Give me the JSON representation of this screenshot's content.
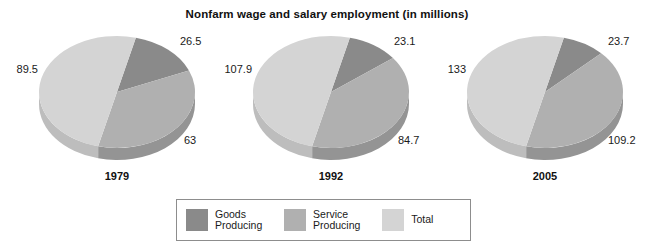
{
  "chart_data": {
    "type": "pie",
    "title": "Nonfarm wage and salary employment (in millions)",
    "subtitle": "",
    "xlabel": "",
    "ylabel": "",
    "unit": "millions",
    "grid": false,
    "legend_position": "bottom",
    "series_names": [
      "Goods Producing",
      "Service Producing",
      "Total"
    ],
    "charts": [
      {
        "year": "1979",
        "labels": [
          "Goods Producing",
          "Service Producing",
          "Total"
        ],
        "values": [
          26.5,
          63,
          89.5
        ],
        "display_values": [
          "26.5",
          "63",
          "89.5"
        ]
      },
      {
        "year": "1992",
        "labels": [
          "Goods Producing",
          "Service Producing",
          "Total"
        ],
        "values": [
          23.1,
          84.7,
          107.9
        ],
        "display_values": [
          "23.1",
          "84.7",
          "107.9"
        ]
      },
      {
        "year": "2005",
        "labels": [
          "Goods Producing",
          "Service Producing",
          "Total"
        ],
        "values": [
          23.7,
          109.2,
          133
        ],
        "display_values": [
          "23.7",
          "109.2",
          "133"
        ]
      }
    ]
  },
  "colors": {
    "goods_producing": "#8a8a8a",
    "service_producing": "#b0b0b0",
    "total": "#d4d4d4",
    "goods_producing_side": "#6e6e6e",
    "service_producing_side": "#949494",
    "total_side": "#bdbdbd",
    "background": "#ffffff",
    "text": "#1a1a1a",
    "legend_border": "#8d8d8d"
  },
  "legend": {
    "items": [
      {
        "label_line1": "Goods",
        "label_line2": "Producing",
        "color_key": "goods_producing"
      },
      {
        "label_line1": "Service",
        "label_line2": "Producing",
        "color_key": "service_producing"
      },
      {
        "label_line1": "Total",
        "label_line2": "",
        "color_key": "total"
      }
    ]
  }
}
